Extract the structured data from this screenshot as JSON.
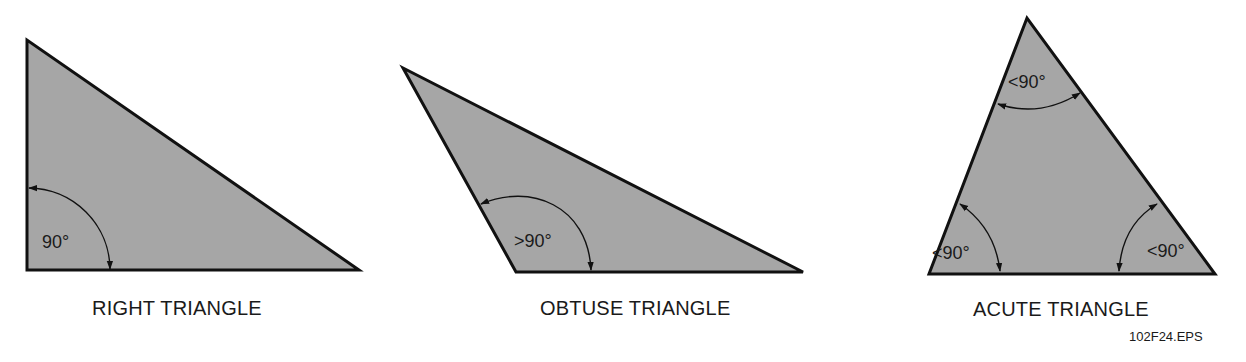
{
  "style": {
    "fill": "#a6a6a6",
    "stroke": "#111111",
    "text": "#1a1a1a"
  },
  "triangles": [
    {
      "id": "right",
      "caption": "RIGHT TRIANGLE",
      "vertices": [
        [
          27,
          40
        ],
        [
          27,
          270
        ],
        [
          359,
          270
        ]
      ],
      "angle_labels": [
        {
          "text": "90°",
          "x": 42,
          "y": 248
        }
      ]
    },
    {
      "id": "obtuse",
      "caption": "OBTUSE TRIANGLE",
      "vertices": [
        [
          403,
          68
        ],
        [
          516,
          272
        ],
        [
          803,
          272
        ]
      ],
      "angle_labels": [
        {
          "text": ">90°",
          "x": 514,
          "y": 247
        }
      ]
    },
    {
      "id": "acute",
      "caption": "ACUTE TRIANGLE",
      "vertices": [
        [
          1027,
          18
        ],
        [
          929,
          274
        ],
        [
          1215,
          274
        ]
      ],
      "angle_labels": [
        {
          "text": "<90°",
          "x": 1008,
          "y": 88
        },
        {
          "text": "<90°",
          "x": 932,
          "y": 259
        },
        {
          "text": "<90°",
          "x": 1147,
          "y": 257
        }
      ]
    }
  ],
  "figure_id": "102F24.EPS"
}
